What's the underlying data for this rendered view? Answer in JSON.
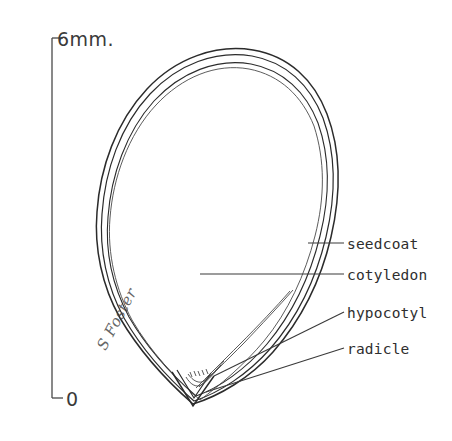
{
  "figure": {
    "background_color": "#ffffff",
    "ink_color": "#2b2b2b",
    "signature": "S Foster"
  },
  "scale_bar": {
    "top_label": "6mm.",
    "bottom_label": "0",
    "axis_top_y": 38,
    "axis_bottom_y": 398,
    "units": "mm"
  },
  "labels": [
    {
      "id": "seedcoat",
      "text": "seedcoat",
      "leader": "horizontal"
    },
    {
      "id": "cotyledon",
      "text": "cotyledon",
      "leader": "horizontal"
    },
    {
      "id": "hypocotyl",
      "text": "hypocotyl",
      "leader": "diagonal"
    },
    {
      "id": "radicle",
      "text": "radicle",
      "leader": "diagonal"
    }
  ]
}
